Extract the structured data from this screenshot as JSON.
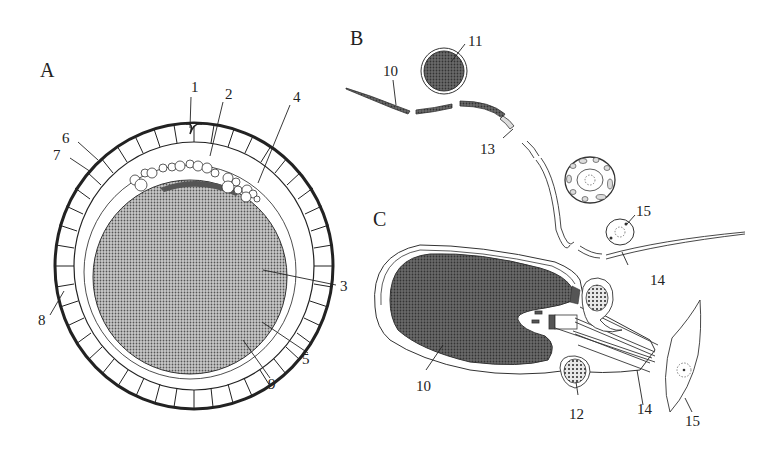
{
  "figure": {
    "panels": [
      {
        "id": "A",
        "label": "A",
        "description": "Oocyte cross-section"
      },
      {
        "id": "B",
        "label": "B",
        "description": "Spermatozoon overview with cross-sections"
      },
      {
        "id": "C",
        "label": "C",
        "description": "Sperm head and midpiece longitudinal section"
      }
    ],
    "panel_a_labels": [
      "1",
      "2",
      "3",
      "4",
      "5",
      "6",
      "7",
      "8",
      "9"
    ],
    "panel_b_labels": [
      "10",
      "11",
      "13",
      "15",
      "14"
    ],
    "panel_c_labels": [
      "10",
      "12",
      "14",
      "15"
    ],
    "colors": {
      "ink": "#222222",
      "fill_dark": "#555555",
      "fill_mid": "#8a8a8a",
      "background": "#ffffff"
    }
  }
}
